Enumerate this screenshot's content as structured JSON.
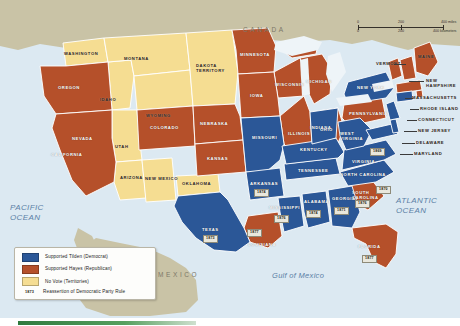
{
  "map": {
    "title": "Presidential Election of 1876",
    "countries": [
      {
        "name": "CANADA"
      },
      {
        "name": "MEXICO"
      }
    ],
    "waters": [
      {
        "name": "PACIFIC\nOCEAN"
      },
      {
        "name": "ATLANTIC\nOCEAN"
      },
      {
        "name": "Gulf of Mexico"
      }
    ],
    "colors": {
      "tilden_blue": "#2b5797",
      "hayes_brown": "#b5502a",
      "territory_yellow": "#f5dd92",
      "land_tan": "#c9c3a6",
      "ocean_blue": "#dce9f2",
      "border_white": "#ffffff",
      "datebox_fill": "#e9e7dc"
    },
    "states": [
      {
        "name": "WASHINGTON",
        "vote": "territory"
      },
      {
        "name": "OREGON",
        "vote": "hayes"
      },
      {
        "name": "CALIFORNIA",
        "vote": "hayes"
      },
      {
        "name": "NEVADA",
        "vote": "hayes"
      },
      {
        "name": "IDAHO",
        "vote": "territory"
      },
      {
        "name": "MONTANA",
        "vote": "territory"
      },
      {
        "name": "WYOMING",
        "vote": "territory"
      },
      {
        "name": "UTAH",
        "vote": "territory"
      },
      {
        "name": "ARIZONA",
        "vote": "territory"
      },
      {
        "name": "NEW MEXICO",
        "vote": "territory"
      },
      {
        "name": "COLORADO",
        "vote": "hayes"
      },
      {
        "name": "DAKOTA TERRITORY",
        "vote": "territory"
      },
      {
        "name": "NEBRASKA",
        "vote": "hayes"
      },
      {
        "name": "KANSAS",
        "vote": "hayes"
      },
      {
        "name": "OKLAHOMA",
        "vote": "territory"
      },
      {
        "name": "TEXAS",
        "vote": "tilden",
        "date": "1873"
      },
      {
        "name": "MINNESOTA",
        "vote": "hayes"
      },
      {
        "name": "IOWA",
        "vote": "hayes"
      },
      {
        "name": "MISSOURI",
        "vote": "tilden"
      },
      {
        "name": "ARKANSAS",
        "vote": "tilden",
        "date": "1874"
      },
      {
        "name": "LOUISIANA",
        "vote": "hayes",
        "date": "1877"
      },
      {
        "name": "MISSISSIPPI",
        "vote": "tilden",
        "date": "1876"
      },
      {
        "name": "WISCONSIN",
        "vote": "hayes"
      },
      {
        "name": "ILLINOIS",
        "vote": "hayes"
      },
      {
        "name": "MICHIGAN",
        "vote": "hayes"
      },
      {
        "name": "INDIANA",
        "vote": "tilden"
      },
      {
        "name": "OHIO",
        "vote": "hayes"
      },
      {
        "name": "KENTUCKY",
        "vote": "tilden"
      },
      {
        "name": "TENNESSEE",
        "vote": "tilden"
      },
      {
        "name": "ALABAMA",
        "vote": "tilden",
        "date": "1874"
      },
      {
        "name": "GEORGIA",
        "vote": "tilden",
        "date": "1871"
      },
      {
        "name": "FLORIDA",
        "vote": "hayes",
        "date": "1877"
      },
      {
        "name": "SOUTH CAROLINA",
        "vote": "hayes",
        "date": "1876"
      },
      {
        "name": "NORTH CAROLINA",
        "vote": "tilden",
        "date": "1870"
      },
      {
        "name": "VIRGINIA",
        "vote": "tilden",
        "date": "1869"
      },
      {
        "name": "WEST VIRGINIA",
        "vote": "tilden"
      },
      {
        "name": "PENNSYLVANIA",
        "vote": "hayes"
      },
      {
        "name": "NEW YORK",
        "vote": "tilden"
      },
      {
        "name": "VERMONT",
        "vote": "hayes"
      },
      {
        "name": "MAINE",
        "vote": "hayes"
      },
      {
        "name": "NEW HAMPSHIRE",
        "vote": "hayes"
      },
      {
        "name": "MASSACHUSETTS",
        "vote": "hayes"
      },
      {
        "name": "RHODE ISLAND",
        "vote": "hayes"
      },
      {
        "name": "CONNECTICUT",
        "vote": "tilden"
      },
      {
        "name": "NEW JERSEY",
        "vote": "tilden"
      },
      {
        "name": "DELAWARE",
        "vote": "tilden"
      },
      {
        "name": "MARYLAND",
        "vote": "tilden"
      }
    ]
  },
  "labels": {
    "canada": "CANADA",
    "mexico": "MEXICO",
    "pacific": "PACIFIC\nOCEAN",
    "atlantic": "ATLANTIC\nOCEAN",
    "gulf": "Gulf of Mexico",
    "washington": "WASHINGTON",
    "oregon": "OREGON",
    "california": "CALIFORNIA",
    "nevada": "NEVADA",
    "idaho": "IDAHO",
    "montana": "MONTANA",
    "wyoming": "WYOMING",
    "utah": "UTAH",
    "arizona": "ARIZONA",
    "new_mexico": "NEW MEXICO",
    "colorado": "COLORADO",
    "dakota": "DAKOTA\nTERRITORY",
    "nebraska": "NEBRASKA",
    "kansas": "KANSAS",
    "oklahoma": "OKLAHOMA",
    "texas": "TEXAS",
    "minnesota": "MINNESOTA",
    "iowa": "IOWA",
    "missouri": "MISSOURI",
    "arkansas": "ARKANSAS",
    "louisiana": "LOUISIANA",
    "mississippi": "MISSISSIPPI",
    "wisconsin": "WISCONSIN",
    "illinois": "ILLINOIS",
    "michigan": "MICHIGAN",
    "indiana": "INDIANA",
    "ohio": "OHIO",
    "kentucky": "KENTUCKY",
    "tennessee": "TENNESSEE",
    "alabama": "ALABAMA",
    "georgia": "GEORGIA",
    "florida": "FLORIDA",
    "south_carolina": "SOUTH\nCAROLINA",
    "north_carolina": "NORTH CAROLINA",
    "virginia": "VIRGINIA",
    "west_virginia": "WEST\nVIRGINIA",
    "pennsylvania": "PENNSYLVANIA",
    "new_york": "NEW YORK",
    "vermont": "VERMONT",
    "maine": "MAINE",
    "new_hampshire": "NEW\nHAMPSHIRE",
    "massachusetts": "MASSACHUSETTS",
    "rhode_island": "RHODE ISLAND",
    "connecticut": "CONNECTICUT",
    "new_jersey": "NEW JERSEY",
    "delaware": "DELAWARE",
    "maryland": "MARYLAND"
  },
  "dates": {
    "virginia": "1869",
    "north_carolina": "1870",
    "georgia": "1871",
    "texas": "1873",
    "arkansas": "1874",
    "alabama": "1874",
    "mississippi": "1876",
    "south_carolina": "1876",
    "louisiana": "1877",
    "florida": "1877"
  },
  "legend": {
    "items": [
      {
        "swatch": "tilden-blue",
        "label": "Supported Tilden (Democrat)"
      },
      {
        "swatch": "hayes-brown",
        "label": "Supported Hayes (Republican)"
      },
      {
        "swatch": "territory-yellow",
        "label": "No Vote (Territories)"
      }
    ],
    "note_date": "1873",
    "note_label": "Reassertion of Democratic Party Rule"
  },
  "scale": {
    "miles": {
      "ticks": [
        "0",
        "200",
        "400"
      ],
      "unit": "miles"
    },
    "kilometers": {
      "ticks": [
        "0",
        "200",
        "400"
      ],
      "unit": "kilometers"
    }
  }
}
